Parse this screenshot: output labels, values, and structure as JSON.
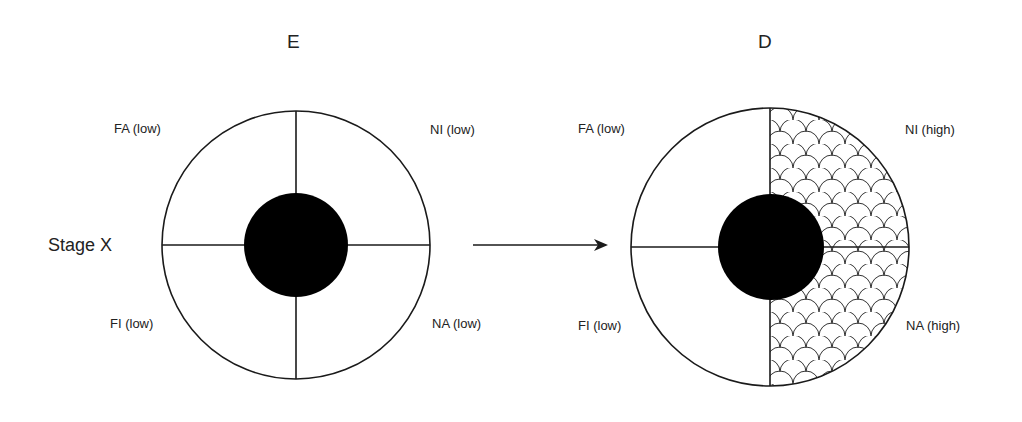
{
  "diagram": {
    "row_label": "Stage X",
    "left": {
      "title": "E",
      "quadrants": {
        "top_left": "FA (low)",
        "top_right": "NI (low)",
        "bottom_left": "FI (low)",
        "bottom_right": "NA (low)"
      },
      "hatched": []
    },
    "arrow": "transition-arrow",
    "right": {
      "title": "D",
      "quadrants": {
        "top_left": "FA (low)",
        "top_right": "NI (high)",
        "bottom_left": "FI (low)",
        "bottom_right": "NA (high)"
      },
      "hatched": [
        "top_right",
        "bottom_right"
      ]
    },
    "colors": {
      "stroke": "#1a1a1a",
      "core": "#000000",
      "background": "#ffffff"
    },
    "pattern": "scallop-hatch"
  }
}
